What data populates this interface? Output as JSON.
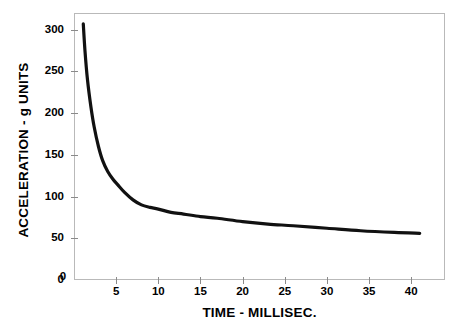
{
  "chart_data": {
    "type": "line",
    "title": "",
    "xlabel": "TIME - MILLISEC.",
    "ylabel": "ACCELERATION - g UNITS",
    "xlim": [
      0,
      44
    ],
    "ylim": [
      0,
      320
    ],
    "grid": false,
    "legend": "none",
    "xticks": [
      5,
      10,
      15,
      20,
      25,
      30,
      35,
      40
    ],
    "yticks": [
      0,
      50,
      100,
      150,
      200,
      250,
      300
    ],
    "series": [
      {
        "name": "acceleration",
        "color": "#111111",
        "x": [
          1.1,
          1.3,
          1.6,
          2.0,
          2.4,
          2.9,
          3.4,
          4.0,
          4.6,
          5.2,
          6.0,
          7.0,
          8.0,
          9.0,
          10.0,
          11.5,
          13.0,
          15.0,
          17.0,
          20.0,
          23.0,
          26.0,
          30.0,
          34.0,
          38.0,
          41.0
        ],
        "y": [
          307,
          275,
          240,
          208,
          183,
          160,
          143,
          130,
          121,
          114,
          105,
          96,
          90,
          87,
          85,
          81,
          79,
          76,
          74,
          70,
          67,
          65,
          62,
          59,
          57,
          56
        ]
      }
    ]
  },
  "axes": {
    "y_tick_labels": [
      "300",
      "250",
      "200",
      "150",
      "100",
      "50",
      "0"
    ],
    "x_tick_labels": [
      "5",
      "10",
      "15",
      "20",
      "25",
      "30",
      "35",
      "40"
    ]
  }
}
